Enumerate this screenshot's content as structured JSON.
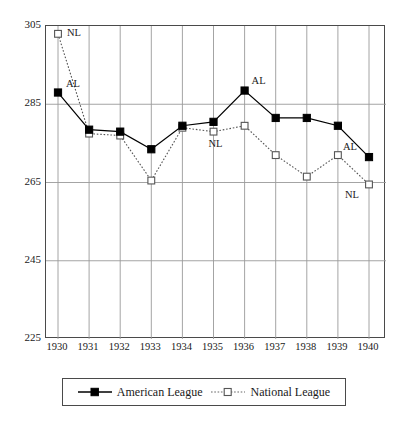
{
  "chart_data": {
    "type": "line",
    "title": "",
    "xlabel": "",
    "ylabel": "",
    "x": [
      1930,
      1931,
      1932,
      1933,
      1934,
      1935,
      1936,
      1937,
      1938,
      1939,
      1940
    ],
    "categories": [
      "1930",
      "1931",
      "1932",
      "1933",
      "1934",
      "1935",
      "1936",
      "1937",
      "1938",
      "1939",
      "1940"
    ],
    "series": [
      {
        "name": "American League",
        "marker": "filled-square",
        "line_style": "solid",
        "color": "#000000",
        "values": [
          288,
          278.5,
          278,
          273.5,
          279.5,
          280.5,
          288.5,
          281.5,
          281.5,
          279.5,
          271.5
        ]
      },
      {
        "name": "National League",
        "marker": "open-square",
        "line_style": "dotted",
        "color": "#555555",
        "values": [
          303,
          277.5,
          277,
          265.5,
          279,
          278,
          279.5,
          272,
          266.5,
          272,
          264.5
        ]
      }
    ],
    "ylim": [
      225,
      305
    ],
    "xlim": [
      1930,
      1940
    ],
    "yticks": [
      225,
      245,
      265,
      285,
      305
    ],
    "ytick_labels": [
      "225",
      "245",
      "265",
      "285",
      "305"
    ],
    "xtick_labels": [
      "1930",
      "1931",
      "1932",
      "1933",
      "1934",
      "1935",
      "1936",
      "1937",
      "1938",
      "1939",
      "1940"
    ],
    "grid": true,
    "grid_color": "#9a9a9a",
    "legend_position": "bottom",
    "annotations": [
      {
        "text": "NL",
        "x": 1930,
        "y": 303,
        "dx": 9,
        "dy": -1
      },
      {
        "text": "AL",
        "x": 1930,
        "y": 288,
        "dx": 8,
        "dy": -9
      },
      {
        "text": "NL",
        "x": 1935,
        "y": 278,
        "dx": -5,
        "dy": 12
      },
      {
        "text": "AL",
        "x": 1936,
        "y": 288.5,
        "dx": 7,
        "dy": -10
      },
      {
        "text": "AL",
        "x": 1940,
        "y": 271.5,
        "dx": -26,
        "dy": -10
      },
      {
        "text": "NL",
        "x": 1940,
        "y": 264.5,
        "dx": -24,
        "dy": 11
      }
    ]
  },
  "legend": {
    "items": [
      {
        "label": "American League"
      },
      {
        "label": "National League"
      }
    ]
  }
}
